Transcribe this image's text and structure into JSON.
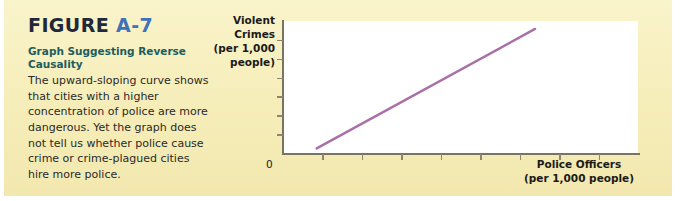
{
  "figure": {
    "label": "FIGURE",
    "number": "A-7",
    "caption_heading": "Graph Suggesting Reverse Causality",
    "caption_body": "The upward-sloping curve shows that cities with a higher concentration of police are more dangerous. Yet the graph does not tell us whether police cause crime or crime-plagued cities hire more police."
  },
  "colors": {
    "panel_background": "#f7f0c0",
    "figure_number": "#3f72b8",
    "figure_label": "#20283a",
    "caption_heading": "#1d5d5e",
    "caption_body": "#2a2a28",
    "plot_background": "#ffffff",
    "axis": "#7a7360",
    "trend_line": "#a96fa8"
  },
  "chart_data": {
    "type": "line",
    "title": "",
    "xlabel": "Police Officers (per 1,000 people)",
    "ylabel": "Violent Crimes (per 1,000 people)",
    "xlabel_lines": [
      "Police Officers",
      "(per 1,000 people)"
    ],
    "ylabel_lines": [
      "Violent",
      "Crimes",
      "(per 1,000",
      "people)"
    ],
    "origin_label": "0",
    "grid": false,
    "legend": false,
    "xlim": [
      0,
      10
    ],
    "ylim": [
      0,
      10
    ],
    "x_tick_count": 8,
    "y_tick_count": 6,
    "x_tick_labels": [],
    "y_tick_labels": [],
    "series": [
      {
        "name": "Violent crimes vs. police officers",
        "x": [
          0.95,
          7.1
        ],
        "values": [
          0.35,
          9.4
        ]
      }
    ],
    "annotations": []
  }
}
